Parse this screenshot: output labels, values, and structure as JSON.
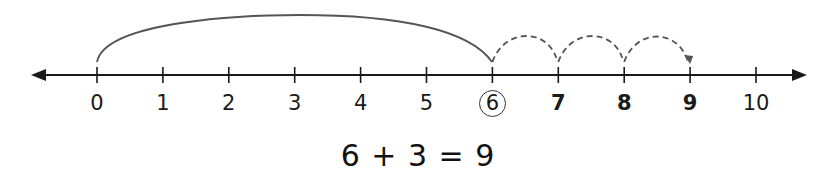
{
  "number_line": {
    "min": 0,
    "max": 10,
    "ticks": [
      {
        "label": "0",
        "style": "normal"
      },
      {
        "label": "1",
        "style": "normal"
      },
      {
        "label": "2",
        "style": "normal"
      },
      {
        "label": "3",
        "style": "normal"
      },
      {
        "label": "4",
        "style": "normal"
      },
      {
        "label": "5",
        "style": "normal"
      },
      {
        "label": "6",
        "style": "circled"
      },
      {
        "label": "7",
        "style": "bold"
      },
      {
        "label": "8",
        "style": "bold"
      },
      {
        "label": "9",
        "style": "bold"
      },
      {
        "label": "10",
        "style": "normal"
      }
    ],
    "big_jump": {
      "from": 0,
      "to": 6,
      "line": "solid"
    },
    "small_jumps": [
      {
        "from": 6,
        "to": 7,
        "line": "dashed"
      },
      {
        "from": 7,
        "to": 8,
        "line": "dashed"
      },
      {
        "from": 8,
        "to": 9,
        "line": "dashed",
        "arrowhead": true
      }
    ],
    "colors": {
      "axis": "#1a1a1a",
      "jump": "#555555"
    }
  },
  "equation": "6 + 3 = 9"
}
